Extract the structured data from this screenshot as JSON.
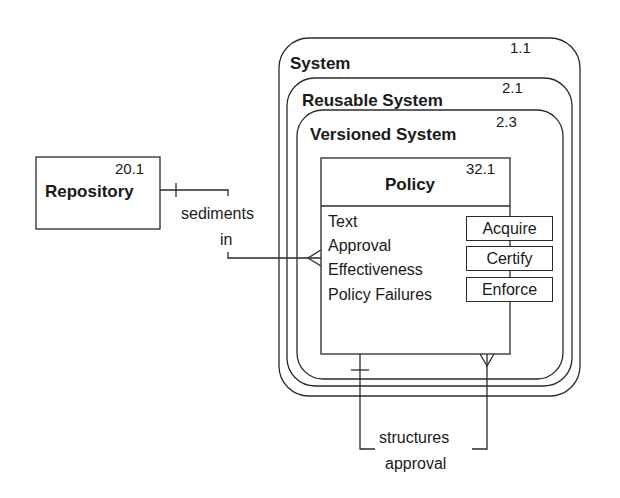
{
  "containers": [
    {
      "name": "System",
      "id": "1.1"
    },
    {
      "name": "Reusable System",
      "id": "2.1"
    },
    {
      "name": "Versioned System",
      "id": "2.3"
    }
  ],
  "policy": {
    "name": "Policy",
    "id": "32.1",
    "attributes": [
      "Text",
      "Approval",
      "Effectiveness",
      "Policy Failures"
    ],
    "operations": [
      "Acquire",
      "Certify",
      "Enforce"
    ]
  },
  "repository": {
    "name": "Repository",
    "id": "20.1"
  },
  "relationships": {
    "sediments": {
      "line1": "sediments",
      "line2": "in"
    },
    "structures": {
      "line1": "structures",
      "line2": "approval"
    }
  },
  "colors": {
    "line": "#2a2a2a",
    "background": "#ffffff"
  }
}
